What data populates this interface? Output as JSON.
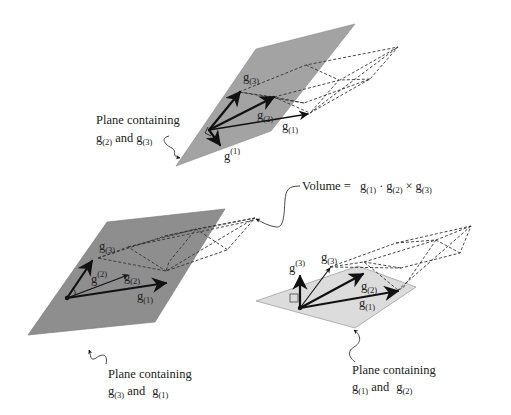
{
  "colors": {
    "plane_dark": "#8e8e8e",
    "plane_top": "#a3a3a3",
    "plane_light": "#dcdcdc",
    "plane_edge": "#555555",
    "vector": "#111111"
  },
  "formula": {
    "prefix": "Volume = ",
    "terms": [
      {
        "base": "g",
        "index": "(1)"
      },
      {
        "op": "·"
      },
      {
        "base": "g",
        "index": "(2)"
      },
      {
        "op": "×"
      },
      {
        "base": "g",
        "index": "(3)"
      }
    ]
  },
  "panels": [
    {
      "id": "top",
      "plane_shade": "medium",
      "caption": {
        "line1": "Plane containing",
        "a_base": "g",
        "a_index": "(2)",
        "and": "and",
        "b_base": "g",
        "b_index": "(3)"
      },
      "vectors": [
        {
          "base": "g",
          "index": "(1)",
          "kind": "covariant"
        },
        {
          "base": "g",
          "index": "(2)",
          "kind": "covariant"
        },
        {
          "base": "g",
          "index": "(3)",
          "kind": "covariant"
        },
        {
          "base": "g",
          "index": "(1)",
          "kind": "contravariant"
        }
      ]
    },
    {
      "id": "bottom-left",
      "plane_shade": "dark",
      "caption": {
        "line1": "Plane containing",
        "a_base": "g",
        "a_index": "(3)",
        "and": "and",
        "b_base": "g",
        "b_index": "(1)"
      },
      "vectors": [
        {
          "base": "g",
          "index": "(1)",
          "kind": "covariant"
        },
        {
          "base": "g",
          "index": "(2)",
          "kind": "covariant"
        },
        {
          "base": "g",
          "index": "(3)",
          "kind": "covariant"
        },
        {
          "base": "g",
          "index": "(2)",
          "kind": "contravariant"
        }
      ]
    },
    {
      "id": "bottom-right",
      "plane_shade": "light",
      "caption": {
        "line1": "Plane containing",
        "a_base": "g",
        "a_index": "(1)",
        "and": "and",
        "b_base": "g",
        "b_index": "(2)"
      },
      "vectors": [
        {
          "base": "g",
          "index": "(1)",
          "kind": "covariant"
        },
        {
          "base": "g",
          "index": "(2)",
          "kind": "covariant"
        },
        {
          "base": "g",
          "index": "(3)",
          "kind": "covariant"
        },
        {
          "base": "g",
          "index": "(3)",
          "kind": "contravariant"
        }
      ]
    }
  ]
}
